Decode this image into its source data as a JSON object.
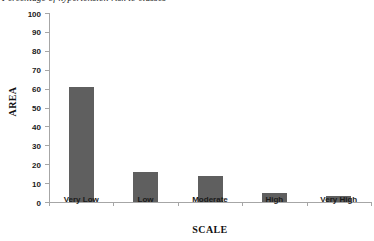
{
  "caption": {
    "text": "Percentage of hypertension risk to classes",
    "note": "cropped-at-top-edge"
  },
  "chart_data": {
    "type": "bar",
    "title": "",
    "subtitle": "",
    "xlabel": "SCALE",
    "ylabel": "AREA",
    "categories": [
      "Very Low",
      "Low",
      "Moderate",
      "High",
      "Very High"
    ],
    "values": [
      61,
      16,
      14,
      5,
      3
    ],
    "series": [
      {
        "name": "AREA",
        "values": [
          61,
          16,
          14,
          5,
          3
        ]
      }
    ],
    "ylim": [
      0,
      100
    ],
    "ytick_step": 10,
    "ytick_labels": [
      "0",
      "10",
      "20",
      "30",
      "40",
      "50",
      "60",
      "70",
      "80",
      "90",
      "100"
    ],
    "grid": false,
    "legend": false,
    "legend_position": "none",
    "bar_color": "#5f5f5f",
    "axis_color": "#a6a6a6",
    "text_color": "#1a1a1a",
    "annotations": []
  }
}
